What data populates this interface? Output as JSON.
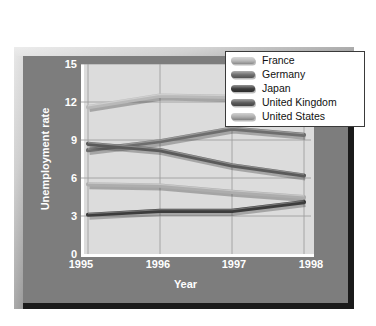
{
  "chart_data": {
    "type": "line",
    "title": "",
    "xlabel": "Year",
    "ylabel": "Unemployment rate",
    "categories": [
      "1995",
      "1996",
      "1997",
      "1998"
    ],
    "x": [
      1995,
      1996,
      1997,
      1998
    ],
    "ylim": [
      0,
      15
    ],
    "yticks": [
      0,
      3,
      6,
      9,
      12,
      15
    ],
    "grid": true,
    "legend_position": "top-right",
    "series": [
      {
        "name": "France",
        "values": [
          11.6,
          12.5,
          12.4,
          11.8
        ],
        "color": "#b9b9b9"
      },
      {
        "name": "Germany",
        "values": [
          8.2,
          8.9,
          9.9,
          9.4
        ],
        "color": "#6e6e6e"
      },
      {
        "name": "Japan",
        "values": [
          3.1,
          3.4,
          3.4,
          4.1
        ],
        "color": "#3c3c3c"
      },
      {
        "name": "United Kingdom",
        "values": [
          8.7,
          8.2,
          7.0,
          6.2
        ],
        "color": "#5a5a5a"
      },
      {
        "name": "United States",
        "values": [
          5.5,
          5.4,
          4.9,
          4.5
        ],
        "color": "#adadad"
      }
    ]
  },
  "axes": {
    "y_title": "Unemployment rate",
    "x_title": "Year",
    "y_tick_labels": [
      "15",
      "12",
      "9",
      "6",
      "3",
      "0"
    ],
    "x_tick_labels": [
      "1995",
      "1996",
      "1997",
      "1998"
    ]
  },
  "legend": {
    "entries": [
      {
        "label": "France"
      },
      {
        "label": "Germany"
      },
      {
        "label": "Japan"
      },
      {
        "label": "United Kingdom"
      },
      {
        "label": "United States"
      }
    ]
  },
  "colors": {
    "page_background": "#ffffff",
    "frame_face": "#7d7d7d",
    "plot_background": "#dcdcdc",
    "gridline": "#9e9e9e",
    "axis_text": "#ffffff",
    "legend_background": "#ffffff",
    "legend_border": "#3a3a3a",
    "frame_shadow": "#1a1a1a"
  }
}
